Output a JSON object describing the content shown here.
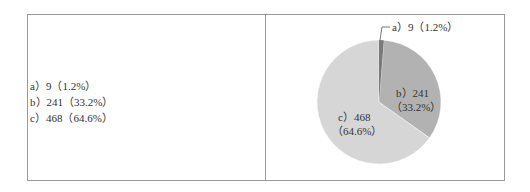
{
  "chart_data": {
    "type": "pie",
    "title": "",
    "categories": [
      "a",
      "b",
      "c"
    ],
    "values": [
      9,
      241,
      468
    ],
    "percentages": [
      1.2,
      33.2,
      64.6
    ],
    "colors": [
      "#8a8a8a",
      "#b2b2b2",
      "#d6d6d6"
    ],
    "labels": [
      "a）9（1.2%）",
      "b）241（33.2%）",
      "c）468（64.6%）"
    ],
    "slice_labels": {
      "a": "a）9（1.2%）",
      "b_line1": "b）241",
      "b_line2": "（33.2%）",
      "c_line1": "c）468",
      "c_line2": "（64.6%）"
    },
    "legend_position": "left-panel"
  },
  "legend": {
    "items": [
      {
        "label": "a）9（1.2%）"
      },
      {
        "label": "b）241（33.2%）"
      },
      {
        "label": "c）468（64.6%）"
      }
    ]
  }
}
